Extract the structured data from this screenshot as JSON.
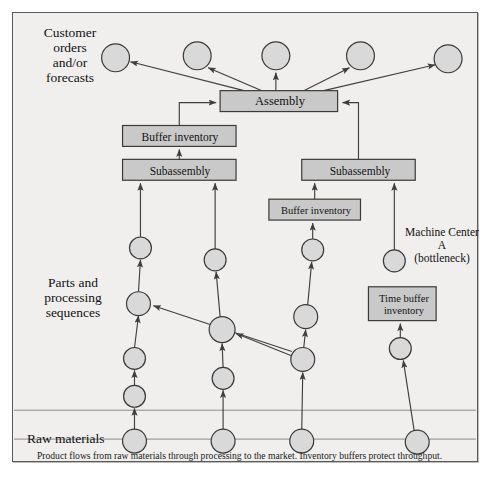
{
  "figure": {
    "labels": {
      "customer": "Customer orders and/or forecasts",
      "customer_lines": [
        "Customer",
        "orders",
        "and/or",
        "forecasts"
      ],
      "parts": "Parts and processing sequences",
      "parts_lines": [
        "Parts and",
        "processing",
        "sequences"
      ],
      "raw": "Raw materials",
      "machine_center_lines": [
        "Machine Center",
        "A",
        "(bottleneck)"
      ]
    },
    "caption": "Product flows from raw materials through processing to the market. Inventory buffers protect throughput.",
    "colors": {
      "background": "#f0efed",
      "frame_border": "#5a5a5a",
      "node_fill": "#d9d9d9",
      "node_stroke": "#3a3a3a",
      "box_fill": "#c9c9c9",
      "box_stroke": "#3a3a3a",
      "arrow": "#444444",
      "divider": "#8a8a8a",
      "text": "#111111"
    },
    "boxes": [
      {
        "id": "assembly",
        "label": "Assembly",
        "x": 208,
        "y": 78,
        "w": 118,
        "h": 21,
        "font": 12.5
      },
      {
        "id": "buffer-left",
        "label": "Buffer inventory",
        "x": 110,
        "y": 113,
        "w": 114,
        "h": 21,
        "font": 11.5
      },
      {
        "id": "subassembly-left",
        "label": "Subassembly",
        "x": 110,
        "y": 147,
        "w": 114,
        "h": 21,
        "font": 11.5
      },
      {
        "id": "subassembly-right",
        "label": "Subassembly",
        "x": 290,
        "y": 147,
        "w": 114,
        "h": 21,
        "font": 11.5
      },
      {
        "id": "buffer-right",
        "label": "Buffer inventory",
        "x": 257,
        "y": 187,
        "w": 92,
        "h": 21,
        "font": 10.5
      },
      {
        "id": "time-buffer",
        "label": "Time buffer inventory",
        "x": 357,
        "y": 275,
        "w": 68,
        "h": 34,
        "font": 10.5,
        "lines": [
          "Time buffer",
          "inventory"
        ]
      }
    ],
    "nodes": [
      {
        "id": "cust-1",
        "x": 103,
        "y": 45,
        "r": 14
      },
      {
        "id": "cust-2",
        "x": 185,
        "y": 43,
        "r": 14
      },
      {
        "id": "cust-3",
        "x": 264,
        "y": 43,
        "r": 14
      },
      {
        "id": "cust-4",
        "x": 349,
        "y": 43,
        "r": 14
      },
      {
        "id": "cust-5",
        "x": 437,
        "y": 46,
        "r": 14
      },
      {
        "id": "p-a1",
        "x": 128,
        "y": 236,
        "r": 11
      },
      {
        "id": "p-a2",
        "x": 126,
        "y": 292,
        "r": 12
      },
      {
        "id": "p-a3",
        "x": 122,
        "y": 347,
        "r": 11
      },
      {
        "id": "p-a4",
        "x": 122,
        "y": 385,
        "r": 11
      },
      {
        "id": "p-a5",
        "x": 122,
        "y": 430,
        "r": 12
      },
      {
        "id": "p-b1",
        "x": 203,
        "y": 248,
        "r": 11
      },
      {
        "id": "p-b2",
        "x": 210,
        "y": 318,
        "r": 13
      },
      {
        "id": "p-b3",
        "x": 211,
        "y": 367,
        "r": 11
      },
      {
        "id": "p-b4",
        "x": 211,
        "y": 430,
        "r": 12
      },
      {
        "id": "p-c1",
        "x": 301,
        "y": 238,
        "r": 11
      },
      {
        "id": "p-c2",
        "x": 294,
        "y": 305,
        "r": 12
      },
      {
        "id": "p-c3",
        "x": 291,
        "y": 348,
        "r": 12
      },
      {
        "id": "p-c4",
        "x": 290,
        "y": 430,
        "r": 12
      },
      {
        "id": "p-d1",
        "x": 383,
        "y": 249,
        "r": 11
      },
      {
        "id": "p-d2",
        "x": 389,
        "y": 337,
        "r": 11
      },
      {
        "id": "p-d3",
        "x": 406,
        "y": 431,
        "r": 12
      }
    ],
    "dividers": [
      {
        "id": "divider-raw",
        "y": 399
      },
      {
        "id": "divider-caption",
        "y": 428
      }
    ]
  }
}
